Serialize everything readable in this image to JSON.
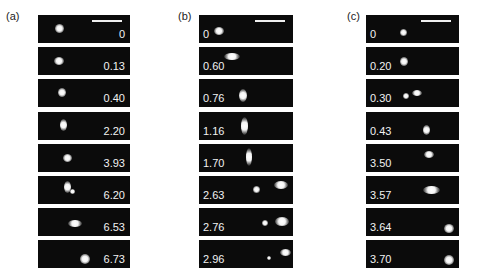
{
  "figure": {
    "panels": [
      {
        "label": "(a)",
        "time_label_side": "right",
        "frames": [
          {
            "time": "0",
            "scale_bar": true,
            "blobs": [
              {
                "x": 17,
                "y": 9,
                "w": 9,
                "h": 9
              }
            ]
          },
          {
            "time": "0.13",
            "blobs": [
              {
                "x": 16,
                "y": 10,
                "w": 10,
                "h": 8
              }
            ]
          },
          {
            "time": "0.40",
            "blobs": [
              {
                "x": 20,
                "y": 9,
                "w": 8,
                "h": 9
              }
            ]
          },
          {
            "time": "2.20",
            "blobs": [
              {
                "x": 22,
                "y": 7,
                "w": 7,
                "h": 12
              }
            ]
          },
          {
            "time": "3.93",
            "blobs": [
              {
                "x": 25,
                "y": 10,
                "w": 9,
                "h": 8
              }
            ]
          },
          {
            "time": "6.20",
            "blobs": [
              {
                "x": 26,
                "y": 5,
                "w": 7,
                "h": 12
              },
              {
                "x": 32,
                "y": 13,
                "w": 5,
                "h": 5
              }
            ]
          },
          {
            "time": "6.53",
            "blobs": [
              {
                "x": 30,
                "y": 12,
                "w": 14,
                "h": 7
              }
            ]
          },
          {
            "time": "6.73",
            "blobs": [
              {
                "x": 42,
                "y": 14,
                "w": 10,
                "h": 10
              }
            ]
          }
        ]
      },
      {
        "label": "(b)",
        "time_label_side": "left",
        "frames": [
          {
            "time": "0",
            "scale_bar": true,
            "blobs": [
              {
                "x": 15,
                "y": 12,
                "w": 10,
                "h": 8
              }
            ]
          },
          {
            "time": "0.60",
            "blobs": [
              {
                "x": 25,
                "y": 6,
                "w": 16,
                "h": 7
              }
            ]
          },
          {
            "time": "0.76",
            "blobs": [
              {
                "x": 40,
                "y": 10,
                "w": 8,
                "h": 13
              }
            ]
          },
          {
            "time": "1.16",
            "blobs": [
              {
                "x": 42,
                "y": 5,
                "w": 7,
                "h": 18
              }
            ]
          },
          {
            "time": "1.70",
            "blobs": [
              {
                "x": 47,
                "y": 4,
                "w": 6,
                "h": 18
              }
            ]
          },
          {
            "time": "2.63",
            "blobs": [
              {
                "x": 54,
                "y": 10,
                "w": 7,
                "h": 7
              },
              {
                "x": 75,
                "y": 5,
                "w": 14,
                "h": 8
              }
            ]
          },
          {
            "time": "2.76",
            "blobs": [
              {
                "x": 63,
                "y": 12,
                "w": 6,
                "h": 6
              },
              {
                "x": 76,
                "y": 9,
                "w": 14,
                "h": 9
              }
            ]
          },
          {
            "time": "2.96",
            "blobs": [
              {
                "x": 68,
                "y": 16,
                "w": 4,
                "h": 4
              },
              {
                "x": 81,
                "y": 9,
                "w": 11,
                "h": 7
              }
            ]
          }
        ]
      },
      {
        "label": "(c)",
        "time_label_side": "left",
        "frames": [
          {
            "time": "0",
            "scale_bar": true,
            "blobs": [
              {
                "x": 34,
                "y": 14,
                "w": 7,
                "h": 7
              }
            ]
          },
          {
            "time": "0.20",
            "blobs": [
              {
                "x": 34,
                "y": 10,
                "w": 8,
                "h": 9
              }
            ]
          },
          {
            "time": "0.30",
            "blobs": [
              {
                "x": 37,
                "y": 14,
                "w": 6,
                "h": 6
              },
              {
                "x": 46,
                "y": 11,
                "w": 10,
                "h": 6
              }
            ]
          },
          {
            "time": "0.43",
            "blobs": [
              {
                "x": 57,
                "y": 13,
                "w": 7,
                "h": 10
              }
            ]
          },
          {
            "time": "3.50",
            "blobs": [
              {
                "x": 58,
                "y": 7,
                "w": 10,
                "h": 7
              }
            ]
          },
          {
            "time": "3.57",
            "blobs": [
              {
                "x": 57,
                "y": 10,
                "w": 17,
                "h": 8
              }
            ]
          },
          {
            "time": "3.64",
            "blobs": [
              {
                "x": 78,
                "y": 16,
                "w": 10,
                "h": 9
              }
            ]
          },
          {
            "time": "3.70",
            "blobs": [
              {
                "x": 78,
                "y": 15,
                "w": 10,
                "h": 10
              }
            ]
          }
        ]
      }
    ]
  }
}
